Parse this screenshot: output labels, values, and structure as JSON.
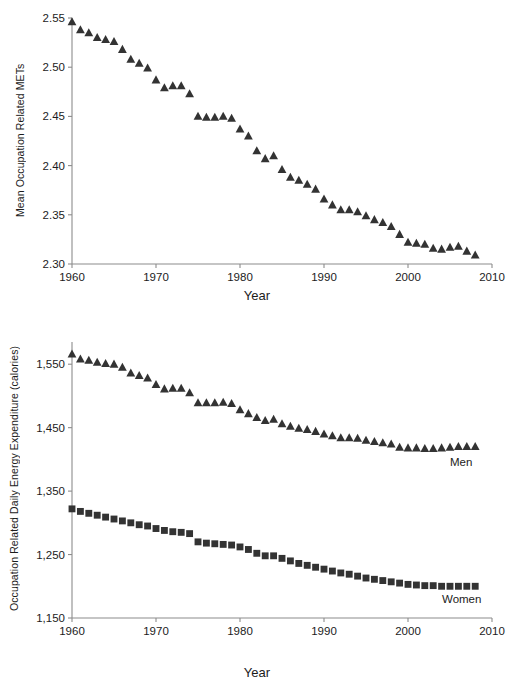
{
  "figure": {
    "top_fragment_text": "",
    "background": "#ffffff",
    "marker_color": "#333333",
    "axis_color": "#8c8c8c",
    "text_color": "#1c1c1c"
  },
  "chart_data": [
    {
      "id": "mets-chart",
      "type": "scatter",
      "title": "",
      "xlabel": "Year",
      "ylabel": "Mean Occupation Related METs",
      "xlim": [
        1960,
        2010
      ],
      "ylim": [
        2.3,
        2.55
      ],
      "xticks": [
        1960,
        1970,
        1980,
        1990,
        2000,
        2010
      ],
      "xtick_labels": [
        "1960",
        "1970",
        "1980",
        "1990",
        "2000",
        "2010"
      ],
      "yticks": [
        2.3,
        2.35,
        2.4,
        2.45,
        2.5,
        2.55
      ],
      "ytick_labels": [
        "2.30",
        "2.35",
        "2.40",
        "2.45",
        "2.50",
        "2.55"
      ],
      "grid": false,
      "legend": "none",
      "marker": "triangle",
      "series": [
        {
          "name": "Mean Occupation Related METs",
          "x": [
            1960,
            1961,
            1962,
            1963,
            1964,
            1965,
            1966,
            1967,
            1968,
            1969,
            1970,
            1971,
            1972,
            1973,
            1974,
            1975,
            1976,
            1977,
            1978,
            1979,
            1980,
            1981,
            1982,
            1983,
            1984,
            1985,
            1986,
            1987,
            1988,
            1989,
            1990,
            1991,
            1992,
            1993,
            1994,
            1995,
            1996,
            1997,
            1998,
            1999,
            2000,
            2001,
            2002,
            2003,
            2004,
            2005,
            2006,
            2007,
            2008
          ],
          "values": [
            2.546,
            2.538,
            2.535,
            2.53,
            2.528,
            2.526,
            2.518,
            2.508,
            2.504,
            2.499,
            2.487,
            2.479,
            2.481,
            2.481,
            2.473,
            2.45,
            2.449,
            2.449,
            2.45,
            2.448,
            2.437,
            2.43,
            2.415,
            2.407,
            2.41,
            2.396,
            2.388,
            2.385,
            2.381,
            2.376,
            2.366,
            2.36,
            2.355,
            2.355,
            2.353,
            2.349,
            2.345,
            2.342,
            2.338,
            2.33,
            2.322,
            2.321,
            2.32,
            2.316,
            2.315,
            2.317,
            2.318,
            2.313,
            2.309
          ]
        }
      ]
    },
    {
      "id": "energy-chart",
      "type": "scatter",
      "title": "",
      "xlabel": "Year",
      "ylabel": "Occupation Related Daily Energy Expenditure (calories)",
      "xlim": [
        1960,
        2010
      ],
      "ylim": [
        1150,
        1585
      ],
      "xticks": [
        1960,
        1970,
        1980,
        1990,
        2000,
        2010
      ],
      "xtick_labels": [
        "1960",
        "1970",
        "1980",
        "1990",
        "2000",
        "2010"
      ],
      "yticks": [
        1150,
        1250,
        1350,
        1450,
        1550
      ],
      "ytick_labels": [
        "1,150",
        "1,250",
        "1,350",
        "1,450",
        "1,550"
      ],
      "grid": false,
      "legend": "inline-annotations",
      "series": [
        {
          "name": "Men",
          "marker": "triangle",
          "label_x": 2005,
          "label_y": 1395,
          "x": [
            1960,
            1961,
            1962,
            1963,
            1964,
            1965,
            1966,
            1967,
            1968,
            1969,
            1970,
            1971,
            1972,
            1973,
            1974,
            1975,
            1976,
            1977,
            1978,
            1979,
            1980,
            1981,
            1982,
            1983,
            1984,
            1985,
            1986,
            1987,
            1988,
            1989,
            1990,
            1991,
            1992,
            1993,
            1994,
            1995,
            1996,
            1997,
            1998,
            1999,
            2000,
            2001,
            2002,
            2003,
            2004,
            2005,
            2006,
            2007,
            2008
          ],
          "values": [
            1566,
            1558,
            1556,
            1553,
            1551,
            1550,
            1545,
            1536,
            1532,
            1528,
            1518,
            1511,
            1512,
            1512,
            1505,
            1489,
            1489,
            1489,
            1490,
            1488,
            1478,
            1472,
            1466,
            1461,
            1463,
            1456,
            1452,
            1449,
            1447,
            1444,
            1440,
            1437,
            1434,
            1434,
            1433,
            1430,
            1428,
            1426,
            1424,
            1419,
            1418,
            1418,
            1417,
            1417,
            1418,
            1419,
            1420,
            1420,
            1420
          ]
        },
        {
          "name": "Women",
          "marker": "square",
          "label_x": 2005,
          "label_y": 1178,
          "x": [
            1960,
            1961,
            1962,
            1963,
            1964,
            1965,
            1966,
            1967,
            1968,
            1969,
            1970,
            1971,
            1972,
            1973,
            1974,
            1975,
            1976,
            1977,
            1978,
            1979,
            1980,
            1981,
            1982,
            1983,
            1984,
            1985,
            1986,
            1987,
            1988,
            1989,
            1990,
            1991,
            1992,
            1993,
            1994,
            1995,
            1996,
            1997,
            1998,
            1999,
            2000,
            2001,
            2002,
            2003,
            2004,
            2005,
            2006,
            2007,
            2008
          ],
          "values": [
            1322,
            1318,
            1315,
            1312,
            1309,
            1306,
            1303,
            1300,
            1297,
            1295,
            1291,
            1288,
            1286,
            1285,
            1283,
            1270,
            1268,
            1267,
            1266,
            1265,
            1262,
            1258,
            1252,
            1248,
            1248,
            1244,
            1240,
            1236,
            1233,
            1230,
            1227,
            1224,
            1221,
            1219,
            1216,
            1213,
            1211,
            1209,
            1207,
            1205,
            1203,
            1202,
            1201,
            1201,
            1200,
            1200,
            1200,
            1200,
            1200
          ]
        }
      ]
    }
  ]
}
